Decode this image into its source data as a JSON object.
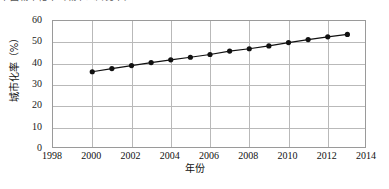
{
  "caption": {
    "text": "中国城市化率（城市人口比率）"
  },
  "chart_data": {
    "type": "line",
    "title": "",
    "xlabel": "年份",
    "ylabel": "城市化率（%）",
    "xlim": [
      1998,
      2014
    ],
    "ylim": [
      0,
      60
    ],
    "xticks": [
      1998,
      2000,
      2002,
      2004,
      2006,
      2008,
      2010,
      2012,
      2014
    ],
    "yticks": [
      0,
      10,
      20,
      30,
      40,
      50,
      60
    ],
    "grid": true,
    "legend": "none",
    "marker": "filled-circle",
    "line_color": "#111111",
    "marker_color": "#111111",
    "series": [
      {
        "name": "城市化率",
        "x": [
          2000,
          2001,
          2002,
          2003,
          2004,
          2005,
          2006,
          2007,
          2008,
          2009,
          2010,
          2011,
          2012,
          2013
        ],
        "values": [
          36.2,
          37.7,
          39.1,
          40.5,
          41.8,
          43.0,
          44.3,
          45.9,
          47.0,
          48.3,
          49.9,
          51.3,
          52.6,
          53.7
        ]
      }
    ]
  },
  "axes": {
    "y_tick_labels": [
      "60",
      "50",
      "40",
      "30",
      "20",
      "10",
      "0"
    ],
    "x_tick_labels": [
      "1998",
      "2000",
      "2002",
      "2004",
      "2006",
      "2008",
      "2010",
      "2012",
      "2014"
    ],
    "x_title": "年份",
    "y_title": "城市化率（%）"
  }
}
